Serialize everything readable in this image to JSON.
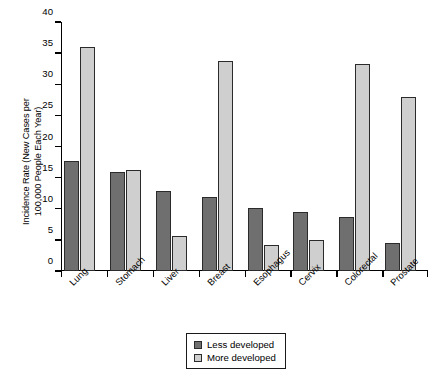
{
  "chart_data": {
    "type": "bar",
    "title": "",
    "xlabel": "",
    "ylabel": "Incidence Rate (New Cases per\n100,000 People Each Year)",
    "categories": [
      "Lung",
      "Stomach",
      "Liver",
      "Breast",
      "Esophagus",
      "Cervix",
      "Colorectal",
      "Prostate"
    ],
    "series": [
      {
        "name": "Less developed",
        "color": "#6f6f6f",
        "values": [
          17.6,
          15.9,
          12.9,
          11.9,
          10.2,
          9.5,
          8.7,
          4.5
        ]
      },
      {
        "name": "More developed",
        "color": "#cfcfcf",
        "values": [
          36.0,
          16.2,
          5.7,
          33.8,
          4.1,
          5.0,
          33.3,
          28.0
        ]
      }
    ],
    "ylim": [
      0,
      40
    ],
    "yticks": [
      0,
      5,
      10,
      15,
      20,
      25,
      30,
      35,
      40
    ],
    "ytick_labels": [
      "0",
      "5",
      "10",
      "15",
      "20",
      "25",
      "30",
      "35",
      "40"
    ],
    "grid": false,
    "legend_position": "bottom-center",
    "legend_entries": [
      "Less developed",
      "More developed"
    ]
  }
}
